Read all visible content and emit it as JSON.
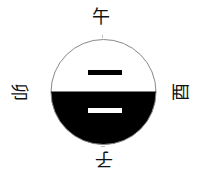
{
  "diagram": {
    "labels": {
      "top": "午",
      "bottom": "子",
      "left": "卯",
      "right": "酉"
    },
    "circle": {
      "cx": 103.5,
      "cy": 92,
      "r": 52.5,
      "stroke": "#888888",
      "upper_fill": "#ffffff",
      "lower_fill": "#000000"
    },
    "lines": [
      {
        "position": "upper",
        "type": "yang",
        "color": "#000000"
      },
      {
        "position": "lower",
        "type": "yang",
        "color": "#ffffff"
      }
    ]
  }
}
